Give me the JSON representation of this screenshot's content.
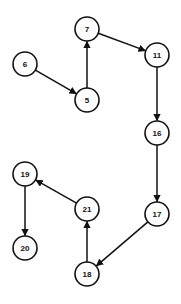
{
  "diagram": {
    "type": "directed-graph",
    "node_radius": 12,
    "colors": {
      "stroke": "#111111",
      "fill": "#ffffff",
      "background": "#ffffff"
    },
    "nodes": [
      {
        "id": "7",
        "label": "7",
        "x": 87,
        "y": 29
      },
      {
        "id": "6",
        "label": "6",
        "x": 25,
        "y": 64
      },
      {
        "id": "11",
        "label": "11",
        "x": 157,
        "y": 55
      },
      {
        "id": "5",
        "label": "5",
        "x": 87,
        "y": 100
      },
      {
        "id": "16",
        "label": "16",
        "x": 157,
        "y": 133
      },
      {
        "id": "19",
        "label": "19",
        "x": 25,
        "y": 174
      },
      {
        "id": "21",
        "label": "21",
        "x": 87,
        "y": 209
      },
      {
        "id": "17",
        "label": "17",
        "x": 157,
        "y": 214
      },
      {
        "id": "20",
        "label": "20",
        "x": 25,
        "y": 248
      },
      {
        "id": "18",
        "label": "18",
        "x": 87,
        "y": 274
      }
    ],
    "edges": [
      {
        "from": "6",
        "to": "5"
      },
      {
        "from": "5",
        "to": "7"
      },
      {
        "from": "7",
        "to": "11"
      },
      {
        "from": "11",
        "to": "16"
      },
      {
        "from": "16",
        "to": "17"
      },
      {
        "from": "17",
        "to": "18"
      },
      {
        "from": "18",
        "to": "21"
      },
      {
        "from": "21",
        "to": "19"
      },
      {
        "from": "19",
        "to": "20"
      }
    ]
  }
}
